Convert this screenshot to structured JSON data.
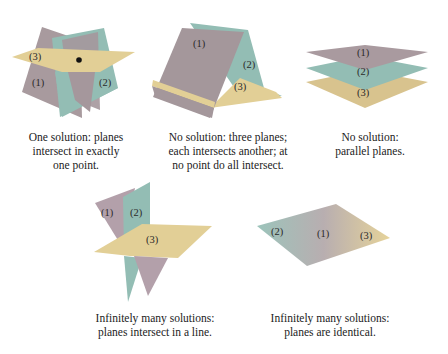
{
  "colors": {
    "plane1": "#a89a9e",
    "plane2": "#93bdb4",
    "plane3": "#e2cf96",
    "background": "#ffffff",
    "text": "#222222"
  },
  "panels": [
    {
      "id": "one-solution",
      "labels": [
        "(1)",
        "(2)",
        "(3)"
      ],
      "caption_lines": [
        "One solution: planes",
        "intersect in exactly",
        "one point."
      ]
    },
    {
      "id": "no-solution-three-planes",
      "labels": [
        "(1)",
        "(2)",
        "(3)"
      ],
      "caption_lines": [
        "No solution: three planes;",
        "each intersects another; at",
        "no point do all intersect."
      ]
    },
    {
      "id": "no-solution-parallel",
      "labels": [
        "(1)",
        "(2)",
        "(3)"
      ],
      "caption_lines": [
        "No solution:",
        "parallel planes."
      ]
    },
    {
      "id": "infinite-line",
      "labels": [
        "(1)",
        "(2)",
        "(3)"
      ],
      "caption_lines": [
        "Infinitely many solutions:",
        "planes intersect in a line."
      ]
    },
    {
      "id": "infinite-identical",
      "labels": [
        "(2)",
        "(1)",
        "(3)"
      ],
      "caption_lines": [
        "Infinitely many solutions:",
        "planes are identical."
      ]
    }
  ]
}
